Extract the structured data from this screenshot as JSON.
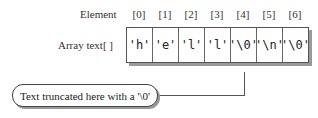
{
  "labels": {
    "element": "Element",
    "array": "Array text[ ]"
  },
  "indices": [
    "[0]",
    "[1]",
    "[2]",
    "[3]",
    "[4]",
    "[5]",
    "[6]"
  ],
  "cells": [
    "'h'",
    "'e'",
    "'l'",
    "'l'",
    "'\\0'",
    "'\\n'",
    "'\\0'"
  ],
  "callout": "Text truncated here with a '\\0'"
}
